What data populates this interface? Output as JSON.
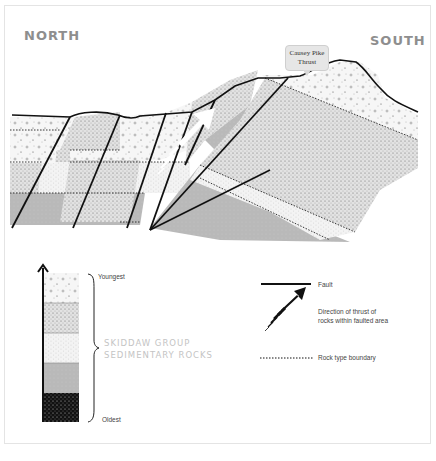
{
  "labels": {
    "north": "NORTH",
    "south": "SOUTH",
    "callout": "Causey Pike Thrust"
  },
  "callout_lines": [
    "Causey Pike",
    "Thrust"
  ],
  "stratigraphy": {
    "top_label": "Youngest",
    "bottom_label": "Oldest",
    "group_line1": "SKIDDAW GROUP",
    "group_line2": "SEDIMENTARY ROCKS",
    "layers": [
      {
        "name": "layer-1-youngest",
        "pattern": "coarse-pebbly",
        "fill": "#f4f4f4"
      },
      {
        "name": "layer-2",
        "pattern": "dense-dotted",
        "fill": "#dcdcdc"
      },
      {
        "name": "layer-3",
        "pattern": "fine-dotted",
        "fill": "#f0f0f0"
      },
      {
        "name": "layer-4",
        "pattern": "solid-grey",
        "fill": "#b9b9b9"
      },
      {
        "name": "layer-5-oldest",
        "pattern": "black-speckled",
        "fill": "#111111"
      }
    ]
  },
  "key": {
    "fault": "Fault",
    "thrust_line1": "Direction of thrust of",
    "thrust_line2": "rocks within faulted area",
    "boundary": "Rock type boundary"
  },
  "colors": {
    "line": "#111111",
    "compass_text": "#8e8e8e",
    "group_text": "#c4c4c4",
    "grey_layer": "#b9b9b9"
  }
}
